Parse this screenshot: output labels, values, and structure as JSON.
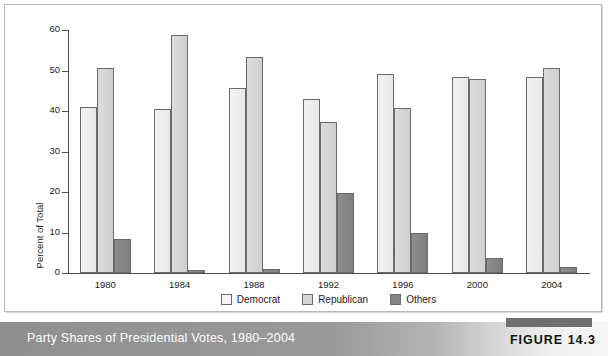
{
  "caption": {
    "title": "Party Shares of Presidential Votes, 1980–2004",
    "figure_number": "FIGURE 14.3"
  },
  "chart_data": {
    "type": "bar",
    "title": "Party Shares of Presidential Votes, 1980–2004",
    "xlabel": "",
    "ylabel": "Percent of Total",
    "ylim": [
      0,
      60
    ],
    "yticks": [
      0,
      10,
      20,
      30,
      40,
      50,
      60
    ],
    "grid": false,
    "legend_position": "bottom-center",
    "categories": [
      "1980",
      "1984",
      "1988",
      "1992",
      "1996",
      "2000",
      "2004"
    ],
    "series": [
      {
        "name": "Democrat",
        "color": "#efefef",
        "values": [
          41.0,
          40.6,
          45.6,
          43.0,
          49.2,
          48.4,
          48.3
        ]
      },
      {
        "name": "Republican",
        "color": "#d6d6d6",
        "values": [
          50.7,
          58.8,
          53.4,
          37.4,
          40.7,
          47.9,
          50.7
        ]
      },
      {
        "name": "Others",
        "color": "#828282",
        "values": [
          8.4,
          0.7,
          1.0,
          19.7,
          10.0,
          3.7,
          1.4
        ]
      }
    ]
  }
}
